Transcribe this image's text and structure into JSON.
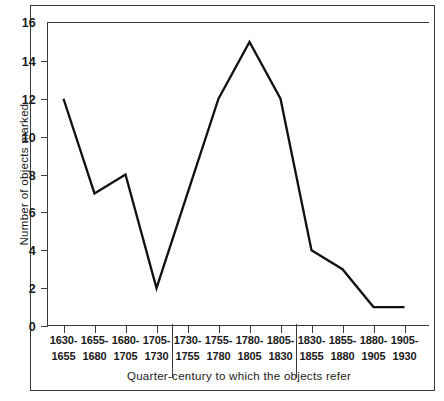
{
  "chart_data": {
    "type": "line",
    "title": "",
    "subtitle": "",
    "xlabel": "Quarter-century to which the objects refer",
    "ylabel": "Number of objects marked",
    "categories": [
      "1630-1655",
      "1655-1680",
      "1680-1705",
      "1705-1730",
      "1730-1755",
      "1755-1780",
      "1780-1805",
      "1805-1830",
      "1830-1855",
      "1855-1880",
      "1880-1905",
      "1905-1930"
    ],
    "category_lines": [
      [
        "1630-",
        "1655"
      ],
      [
        "1655-",
        "1680"
      ],
      [
        "1680-",
        "1705"
      ],
      [
        "1705-",
        "1730"
      ],
      [
        "1730-",
        "1755"
      ],
      [
        "1755-",
        "1780"
      ],
      [
        "1780-",
        "1805"
      ],
      [
        "1805-",
        "1830"
      ],
      [
        "1830-",
        "1855"
      ],
      [
        "1855-",
        "1880"
      ],
      [
        "1880-",
        "1905"
      ],
      [
        "1905-",
        "1930"
      ]
    ],
    "values": [
      12,
      7,
      8,
      2,
      7,
      12,
      15,
      12,
      4,
      3,
      1,
      1
    ],
    "ylim": [
      0,
      16
    ],
    "yticks": [
      0,
      2,
      4,
      6,
      8,
      10,
      12,
      14,
      16
    ],
    "ytick_labels": [
      "0",
      "2",
      "4",
      "6",
      "8",
      "10",
      "12",
      "14",
      "16"
    ],
    "grid": false,
    "legend": "none",
    "group_separators_after": [
      4,
      8
    ],
    "line_color": "#111111",
    "background_color": "#ffffff",
    "axis_color": "#3a3a3a"
  }
}
